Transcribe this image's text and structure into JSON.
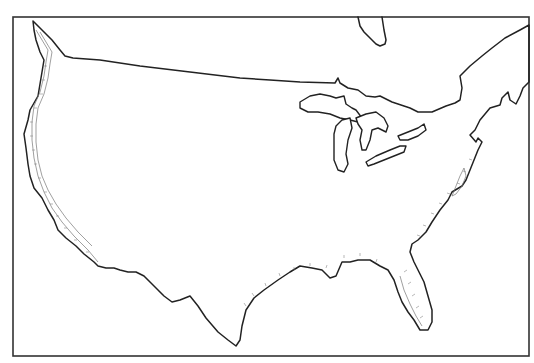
{
  "map": {
    "subject": "Contiguous United States outline with Great Lakes and coastal contour bands",
    "colors": {
      "background": "#ffffff",
      "outline": "#222222",
      "frame": "#333333",
      "contour": "#777777"
    },
    "frame": {
      "x": 13,
      "y": 17,
      "width": 516,
      "height": 339
    },
    "paths": {
      "mainland": "M33,21 L40,28 L46,34 L52,40 L60,50 L65,56 L73,58 L100,60 L140,66 L190,72 L240,78 L270,80 L300,82 L335,83 L338,78 L340,83 L348,88 L358,90 L366,96 L375,97 L380,96 L392,102 L410,108 L418,112 L432,112 L446,106 L455,103 L460,100 L462,88 L460,76 L470,66 L482,56 L492,48 L505,38 L520,30 L529,25 L529,82 L523,88 L520,96 L516,104 L510,100 L508,92 L502,98 L500,105 L490,108 L480,120 L475,130 L470,135 L476,142 L478,138 L482,142 L478,150 L474,160 L470,170 L466,180 L462,186 L452,192 L448,200 L440,210 L432,222 L426,232 L418,240 L412,244 L410,252 L414,262 L418,270 L424,282 L428,296 L432,310 L432,322 L428,330 L420,330 L414,320 L408,312 L402,302 L398,292 L394,280 L388,270 L380,266 L370,260 L358,260 L350,262 L342,262 L336,276 L330,278 L326,274 L322,270 L312,268 L300,266 L290,272 L278,280 L264,290 L254,298 L246,310 L242,326 L240,340 L236,346 L228,340 L218,332 L206,318 L198,306 L190,296 L180,300 L172,302 L164,296 L158,290 L150,282 L144,276 L136,272 L128,272 L120,270 L114,268 L106,268 L98,266 L94,262 L84,254 L76,246 L66,238 L58,230 L54,220 L48,210 L42,198 L34,188 L30,176 L28,164 L26,148 L24,134 L28,120 L30,110 L38,96 L40,84 L42,72 L44,60 L40,52 L36,40 L34,30 Z",
      "lake_superior": "M300,102 L310,96 L320,94 L330,96 L336,98 L344,96 L346,104 L352,108 L356,110 L362,118 L358,122 L350,120 L340,118 L330,114 L318,112 L308,112 L300,108 Z",
      "lake_michigan": "M336,126 L342,120 L350,118 L352,128 L348,140 L346,154 L348,164 L344,172 L338,170 L334,160 L334,146 L334,134 Z",
      "lake_huron": "M356,118 L366,114 L376,112 L384,118 L388,126 L386,132 L378,128 L372,130 L370,140 L366,150 L362,150 L360,140 L362,130 L358,124 Z",
      "lake_erie": "M366,162 L376,156 L390,150 L400,146 L406,146 L404,152 L394,156 L384,160 L374,164 L368,166 Z",
      "lake_ontario": "M398,136 L408,132 L418,128 L424,124 L426,130 L418,136 L408,140 L400,140 Z",
      "hudson_bay_tip": "M358,17 L360,26 L364,32 L370,38 L376,44 L380,46 L385,44 L386,40 L384,30 L382,17",
      "florida_ticks": "M404,272 l3,-2 M408,284 l3,-2 M412,296 l3,-2 M416,308 l3,-2 M420,318 l3,-2",
      "gulf_ticks": "M246,306 l-2,-3 M254,296 l-2,-3 M266,286 l-1,-3 M280,276 l-1,-3 M294,270 l0,-3 M310,266 l0,-3 M326,268 l1,-3 M344,258 l0,-3 M360,256 l0,-3 M376,262 l1,-3",
      "atlantic_ticks": "M420,236 l-3,-1 M426,226 l-3,-1 M434,214 l-3,-1 M442,204 l-3,-1 M450,194 l-3,-1 M460,184 l-3,-1 M466,172 l-3,-1 M472,160 l-3,-1",
      "pacific_ticks": "M44,66 l3,0 M42,80 l3,0 M40,94 l3,0 M34,108 l3,0 M30,122 l3,0 M30,136 l3,0 M32,150 l3,0 M34,164 l3,0 M38,178 l3,0 M44,192 l3,0 M50,204 l3,0 M56,216 l3,0 M64,228 l3,0 M74,240 l3,0 M86,252 l3,0",
      "pacific_contour_1": "M36,30 L42,40 L48,50 L46,62 L44,76 L40,92 L34,106 L32,122 L32,140 L34,158 L38,176 L44,192 L52,208 L62,222 L74,236 L88,250 L98,262",
      "pacific_contour_2": "M40,32 L46,42 L52,52 L50,64 L48,78 L44,94 L38,108 L36,124 L36,142 L38,160 L42,176 L48,190 L56,204 L66,218 L78,232 L92,246",
      "chesapeake_contour": "M452,196 L456,186 L460,176 L464,168 L466,176 L462,186 L456,194 Z",
      "florida_contour": "M400,276 L404,290 L410,304 L416,316 L422,326"
    }
  }
}
